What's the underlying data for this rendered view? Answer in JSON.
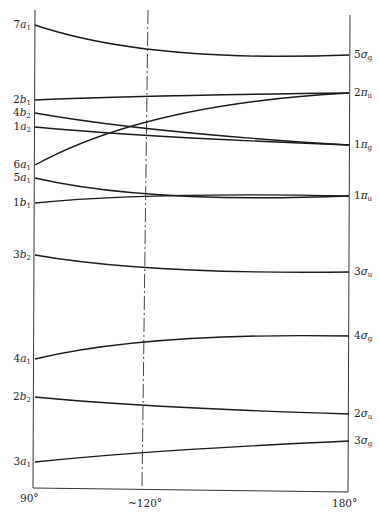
{
  "chart_data": {
    "type": "line",
    "xlabel": "",
    "ylabel": "",
    "x": [
      90,
      120,
      180
    ],
    "x_tick_labels": [
      "90°",
      "~120°",
      "180°"
    ],
    "reference_line": {
      "x_label": "~120°",
      "style": "dash-dot"
    },
    "grid": false,
    "left_labels": [
      "7a1",
      "2b1",
      "4b2",
      "1a2",
      "6a1",
      "5a1",
      "1b1",
      "3b2",
      "4a1",
      "2b2",
      "3a1"
    ],
    "right_labels": [
      "5σg",
      "2πu",
      "1πg",
      "1πu",
      "3σu",
      "4σg",
      "2σu",
      "3σg"
    ],
    "series": [
      {
        "name": "7a1 → 5σg",
        "from": "7a1",
        "to": "5σg",
        "y_pixels": [
          25,
          46,
          55
        ]
      },
      {
        "name": "2b1 → 2πu",
        "from": "2b1",
        "to": "2πu",
        "y_pixels": [
          100,
          97,
          93
        ]
      },
      {
        "name": "4b2 → 1πg",
        "from": "4b2",
        "to": "1πg",
        "y_pixels": [
          113,
          126,
          145
        ]
      },
      {
        "name": "1a2 → 1πg",
        "from": "1a2",
        "to": "1πg",
        "y_pixels": [
          127,
          134,
          145
        ]
      },
      {
        "name": "6a1 → 2πu",
        "from": "6a1",
        "to": "2πu",
        "y_pixels": [
          165,
          128,
          93
        ]
      },
      {
        "name": "5a1 → 1πu",
        "from": "5a1",
        "to": "1πu",
        "y_pixels": [
          178,
          192,
          196
        ]
      },
      {
        "name": "1b1 → 1πu",
        "from": "1b1",
        "to": "1πu",
        "y_pixels": [
          203,
          197,
          196
        ]
      },
      {
        "name": "3b2 → 3σu",
        "from": "3b2",
        "to": "3σu",
        "y_pixels": [
          255,
          266,
          272
        ]
      },
      {
        "name": "4a1 → 4σg",
        "from": "4a1",
        "to": "4σg",
        "y_pixels": [
          359,
          344,
          336
        ]
      },
      {
        "name": "2b2 → 2σu",
        "from": "2b2",
        "to": "2σu",
        "y_pixels": [
          397,
          404,
          414
        ]
      },
      {
        "name": "3a1 → 3σg",
        "from": "3a1",
        "to": "3σg",
        "y_pixels": [
          462,
          454,
          441
        ]
      }
    ],
    "note": "Energy axis is unlabeled; y values given as pixel positions (lower pixel = higher energy)."
  },
  "axis": {
    "tick_90": "90°",
    "tick_120": "~120°",
    "tick_180": "180°"
  },
  "labels_left": [
    {
      "n": "7",
      "s": "a",
      "sub": "1"
    },
    {
      "n": "2",
      "s": "b",
      "sub": "1"
    },
    {
      "n": "4",
      "s": "b",
      "sub": "2"
    },
    {
      "n": "1",
      "s": "a",
      "sub": "2"
    },
    {
      "n": "6",
      "s": "a",
      "sub": "1"
    },
    {
      "n": "5",
      "s": "a",
      "sub": "1"
    },
    {
      "n": "1",
      "s": "b",
      "sub": "1"
    },
    {
      "n": "3",
      "s": "b",
      "sub": "2"
    },
    {
      "n": "4",
      "s": "a",
      "sub": "1"
    },
    {
      "n": "2",
      "s": "b",
      "sub": "2"
    },
    {
      "n": "3",
      "s": "a",
      "sub": "1"
    }
  ],
  "labels_right": [
    {
      "n": "5",
      "s": "σ",
      "sub": "g"
    },
    {
      "n": "2",
      "s": "π",
      "sub": "u"
    },
    {
      "n": "1",
      "s": "π",
      "sub": "g"
    },
    {
      "n": "1",
      "s": "π",
      "sub": "u"
    },
    {
      "n": "3",
      "s": "σ",
      "sub": "u"
    },
    {
      "n": "4",
      "s": "σ",
      "sub": "g"
    },
    {
      "n": "2",
      "s": "σ",
      "sub": "u"
    },
    {
      "n": "3",
      "s": "σ",
      "sub": "g"
    }
  ]
}
